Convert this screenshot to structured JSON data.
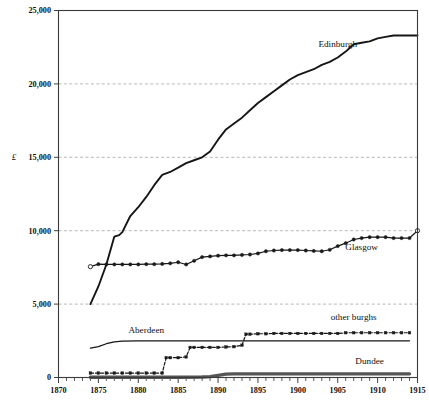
{
  "chart_data": {
    "type": "line",
    "title": "",
    "xlabel": "",
    "ylabel": "£",
    "xlim": [
      1870,
      1915
    ],
    "ylim": [
      0,
      25000
    ],
    "grid": true,
    "grid_axis": "y",
    "legend": "inline-annotations",
    "ytick_labels": [
      "0",
      "5,000",
      "10,000",
      "15,000",
      "20,000",
      "25,000"
    ],
    "ytick_values": [
      0,
      5000,
      10000,
      15000,
      20000,
      25000
    ],
    "xtick_labels": [
      "1870",
      "1875",
      "1880",
      "1885",
      "1890",
      "1895",
      "1900",
      "1905",
      "1910",
      "1915"
    ],
    "xtick_values": [
      1870,
      1875,
      1880,
      1885,
      1890,
      1895,
      1900,
      1905,
      1910,
      1915
    ],
    "x_minor_step": 1,
    "series": [
      {
        "name": "Edinburgh",
        "style": "solid-thick",
        "marker": "none",
        "x": [
          1874,
          1875,
          1876,
          1877,
          1877.6,
          1878,
          1879,
          1880,
          1881,
          1882,
          1883,
          1884,
          1885,
          1886,
          1887,
          1888,
          1889,
          1890,
          1891,
          1892,
          1893,
          1894,
          1895,
          1896,
          1897,
          1898,
          1899,
          1900,
          1901,
          1902,
          1903,
          1904,
          1905,
          1906,
          1907,
          1908,
          1909,
          1910,
          1911,
          1912,
          1913,
          1914,
          1915
        ],
        "values": [
          5000,
          6200,
          7700,
          9600,
          9700,
          9900,
          11000,
          11600,
          12300,
          13100,
          13800,
          14000,
          14300,
          14600,
          14800,
          15000,
          15400,
          16200,
          16900,
          17300,
          17700,
          18200,
          18700,
          19100,
          19500,
          19900,
          20300,
          20600,
          20800,
          21000,
          21300,
          21500,
          21800,
          22200,
          22700,
          22800,
          22900,
          23100,
          23200,
          23300,
          23300,
          23300,
          23300
        ]
      },
      {
        "name": "Glasgow",
        "style": "solid-thin",
        "marker": "circle",
        "x": [
          1874,
          1875,
          1876,
          1877,
          1878,
          1879,
          1880,
          1881,
          1882,
          1883,
          1884,
          1885,
          1886,
          1887,
          1888,
          1889,
          1890,
          1891,
          1892,
          1893,
          1894,
          1895,
          1896,
          1897,
          1898,
          1899,
          1900,
          1901,
          1902,
          1903,
          1904,
          1905,
          1906,
          1907,
          1908,
          1909,
          1910,
          1911,
          1912,
          1913,
          1914,
          1915
        ],
        "values": [
          7550,
          7720,
          7700,
          7700,
          7700,
          7700,
          7700,
          7720,
          7720,
          7740,
          7780,
          7850,
          7700,
          7950,
          8200,
          8250,
          8300,
          8320,
          8320,
          8350,
          8380,
          8450,
          8600,
          8650,
          8680,
          8680,
          8680,
          8650,
          8620,
          8600,
          8700,
          8950,
          9150,
          9400,
          9500,
          9560,
          9560,
          9560,
          9500,
          9500,
          9500,
          10000
        ]
      },
      {
        "name": "Aberdeen",
        "style": "solid-thin",
        "marker": "none",
        "x": [
          1874,
          1875,
          1876,
          1877,
          1878,
          1880,
          1885,
          1890,
          1895,
          1900,
          1905,
          1910,
          1914
        ],
        "values": [
          2000,
          2100,
          2300,
          2420,
          2480,
          2500,
          2500,
          2500,
          2500,
          2500,
          2500,
          2500,
          2500
        ]
      },
      {
        "name": "other burghs",
        "style": "dashed",
        "marker": "square",
        "x": [
          1874,
          1875,
          1876,
          1877,
          1878,
          1879,
          1880,
          1881,
          1882,
          1883,
          1883.5,
          1884,
          1885,
          1886,
          1886.5,
          1887,
          1888,
          1889,
          1890,
          1891,
          1892,
          1893,
          1893.5,
          1894,
          1895,
          1896,
          1897,
          1898,
          1899,
          1900,
          1901,
          1902,
          1903,
          1904,
          1905,
          1906,
          1907,
          1908,
          1909,
          1910,
          1911,
          1912,
          1913,
          1914
        ],
        "values": [
          300,
          300,
          300,
          300,
          300,
          300,
          300,
          300,
          300,
          300,
          1350,
          1350,
          1350,
          1400,
          2050,
          2050,
          2050,
          2050,
          2050,
          2080,
          2100,
          2200,
          2950,
          2950,
          2980,
          2980,
          3000,
          3000,
          3000,
          3000,
          3000,
          3000,
          3000,
          3000,
          3000,
          3050,
          3050,
          3050,
          3050,
          3050,
          3050,
          3050,
          3050,
          3050
        ]
      },
      {
        "name": "Dundee",
        "style": "solid-band",
        "marker": "none",
        "x": [
          1874,
          1880,
          1885,
          1888,
          1889,
          1890,
          1891,
          1892,
          1895,
          1900,
          1905,
          1910,
          1914
        ],
        "values": [
          20,
          20,
          20,
          30,
          60,
          140,
          230,
          250,
          250,
          250,
          250,
          250,
          250
        ]
      }
    ],
    "annotations": [
      {
        "text": "Edinburgh",
        "x": 1905,
        "y": 22500
      },
      {
        "text": "Glasgow",
        "x": 1908,
        "y": 8700
      },
      {
        "text": "other burghs",
        "x": 1907,
        "y": 3900
      },
      {
        "text": "Aberdeen",
        "x": 1881,
        "y": 3050
      },
      {
        "text": "Dundee",
        "x": 1909,
        "y": 900
      }
    ],
    "colors": {
      "line": "#161616",
      "dundee_band": "#555555",
      "grid": "#9a9a9a",
      "frame": "#3a3a3a",
      "background": "#ffffff"
    }
  },
  "axis": {
    "y_unit_symbol": "£"
  },
  "caption": {
    "text": ""
  }
}
